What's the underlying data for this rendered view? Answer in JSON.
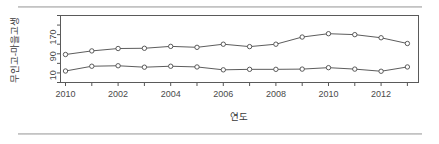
{
  "figure": {
    "background_color": "#ffffff",
    "rule_color": "#c2c2c2",
    "line_color": "#4a4a4a",
    "marker_fill": "#ffffff"
  },
  "chart_data": {
    "type": "line",
    "title": "",
    "subtitle": "",
    "xlabel": "연도",
    "ylabel": "무인고-마을고생",
    "grid": false,
    "legend_position": "none",
    "x": [
      2010,
      2001,
      2002,
      2003,
      2004,
      2005,
      2006,
      2007,
      2008,
      2009,
      2010,
      2011,
      2012,
      2013
    ],
    "xtick_positions": [
      2010,
      2002,
      2004,
      2006,
      2008,
      2010,
      2012
    ],
    "xtick_labels": [
      "2010",
      "2002",
      "2004",
      "2006",
      "2008",
      "2010",
      "2012"
    ],
    "xlim": [
      2009.4,
      2013.6
    ],
    "ytick_positions": [
      10,
      90,
      170
    ],
    "ytick_labels": [
      "10",
      "90",
      "170"
    ],
    "ylim": [
      -20,
      260
    ],
    "series": [
      {
        "name": "upper",
        "values": [
          97,
          112,
          122,
          123,
          131,
          127,
          140,
          130,
          140,
          170,
          184,
          180,
          167,
          143
        ]
      },
      {
        "name": "lower",
        "values": [
          28,
          48,
          50,
          44,
          48,
          45,
          33,
          35,
          35,
          36,
          42,
          36,
          27,
          45
        ]
      }
    ]
  }
}
